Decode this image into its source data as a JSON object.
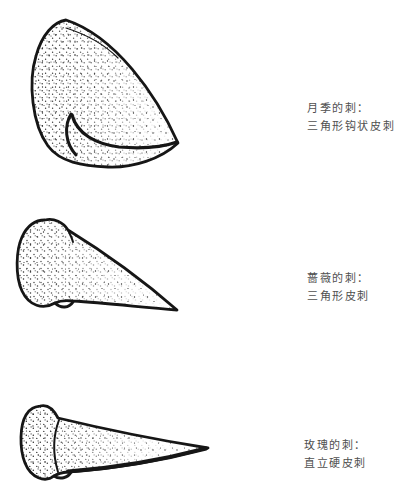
{
  "colors": {
    "ink": "#161616",
    "label": "#4f4f4f",
    "bg": "#ffffff"
  },
  "labels": [
    {
      "line1": "月季的刺：",
      "line2": "三角形钩状皮刺"
    },
    {
      "line1": "蔷薇的刺：",
      "line2": "三角形皮刺"
    },
    {
      "line1": "玫瑰的刺：",
      "line2": "直立硬皮刺"
    }
  ]
}
